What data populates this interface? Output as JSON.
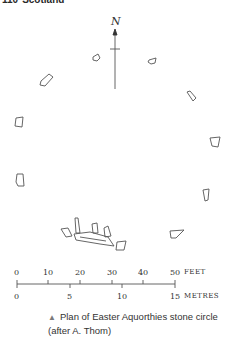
{
  "header": {
    "page_number": "110",
    "section": "Scotland"
  },
  "north_label": "N",
  "scale": {
    "feet_ticks": [
      "0",
      "10",
      "20",
      "30",
      "40",
      "50"
    ],
    "feet_unit": "FEET",
    "metre_ticks": [
      "0",
      "5",
      "10",
      "15"
    ],
    "metre_unit": "METRES"
  },
  "caption": {
    "marker": "▲",
    "text": "Plan of Easter Aquorthies stone circle (after A. Thom)"
  },
  "colors": {
    "ink": "#444444",
    "caption_marker": "#7a7a7a"
  }
}
